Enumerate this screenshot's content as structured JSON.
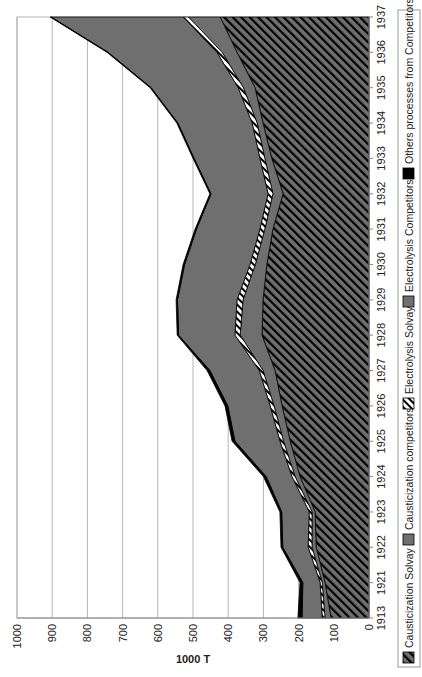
{
  "chart_data": {
    "type": "area",
    "stacked": true,
    "orientation": "rotated-90-ccw",
    "title": "",
    "xlabel": "",
    "ylabel": "1000 T",
    "ylim": [
      0,
      1000
    ],
    "yticks": [
      0,
      100,
      200,
      300,
      400,
      500,
      600,
      700,
      800,
      900,
      1000
    ],
    "grid": true,
    "legend_position": "right",
    "categories": [
      "1913",
      "1921",
      "1922",
      "1923",
      "1924",
      "1925",
      "1926",
      "1927",
      "1928",
      "1929",
      "1930",
      "1931",
      "1932",
      "1933",
      "1934",
      "1935",
      "1936",
      "1937"
    ],
    "series": [
      {
        "name": "Causticization Solvay",
        "pattern": "hatch-dark",
        "color": "#6f6f6f",
        "values": [
          108,
          125,
          150,
          153,
          196,
          224,
          247,
          267,
          304,
          301,
          290,
          273,
          244,
          276,
          301,
          324,
          375,
          423
        ]
      },
      {
        "name": "Causticization competitors",
        "pattern": "solid",
        "color": "#6f6f6f",
        "values": [
          17,
          8,
          12,
          9,
          14,
          19,
          23,
          34,
          62,
          57,
          33,
          23,
          29,
          20,
          17,
          33,
          42,
          90
        ]
      },
      {
        "name": "Electrolysis Solvay",
        "pattern": "hatch-light",
        "color": "#ffffff",
        "values": [
          8,
          6,
          11,
          8,
          9,
          10,
          11,
          11,
          15,
          17,
          15,
          14,
          14,
          14,
          14,
          15,
          15,
          15
        ]
      },
      {
        "name": "Electrolysis Competitors",
        "pattern": "solid",
        "color": "#6f6f6f",
        "values": [
          57,
          49,
          72,
          78,
          73,
          128,
          120,
          140,
          160,
          169,
          186,
          180,
          162,
          187,
          211,
          247,
          309,
          375
        ]
      },
      {
        "name": "Others processes from Competitors",
        "pattern": "solid",
        "color": "#000000",
        "values": [
          12,
          8,
          5,
          5,
          8,
          8,
          8,
          8,
          4,
          4,
          4,
          4,
          3,
          3,
          3,
          3,
          3,
          3
        ]
      }
    ]
  }
}
